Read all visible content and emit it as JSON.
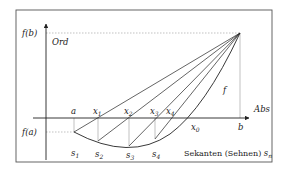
{
  "diagram": {
    "axis_labels": {
      "ordinate": "Ord",
      "abscissa": "Abs"
    },
    "value_labels": {
      "f_b": "f(b)",
      "f_a": "f(a)",
      "a": "a",
      "b": "b",
      "x0": "x",
      "x0_sub": "0",
      "function": "f"
    },
    "x_points": [
      {
        "name": "x",
        "sub": "1"
      },
      {
        "name": "x",
        "sub": "2"
      },
      {
        "name": "x",
        "sub": "3"
      },
      {
        "name": "x",
        "sub": "4"
      }
    ],
    "s_points": [
      {
        "name": "s",
        "sub": "1"
      },
      {
        "name": "s",
        "sub": "2"
      },
      {
        "name": "s",
        "sub": "3"
      },
      {
        "name": "s",
        "sub": "4"
      }
    ],
    "caption": {
      "text": "Sekanten (Sehnen) ",
      "var": "s",
      "sub": "n"
    },
    "colors": {
      "line": "#222222",
      "dashed": "#888888",
      "frame": "#555555"
    }
  }
}
